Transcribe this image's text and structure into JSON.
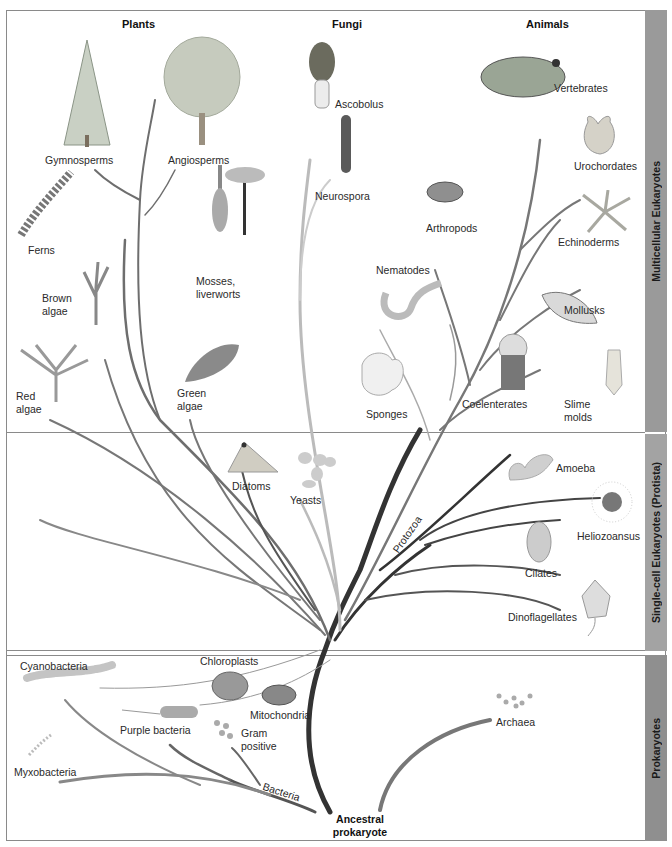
{
  "diagram": {
    "column_headers": [
      "Plants",
      "Fungi",
      "Animals"
    ],
    "side_bands": {
      "multicellular": "Multicellular Eukaryotes",
      "single_cell": "Single-cell Eukaryotes (Protista)",
      "prokaryotes": "Prokaryotes"
    },
    "plants": {
      "gymnosperms": "Gymnosperms",
      "angiosperms": "Angiosperms",
      "ferns": "Ferns",
      "mosses_line1": "Mosses,",
      "mosses_line2": "liverworts",
      "brown_line1": "Brown",
      "brown_line2": "algae",
      "red_line1": "Red",
      "red_line2": "algae",
      "green_line1": "Green",
      "green_line2": "algae"
    },
    "fungi": {
      "ascobolus": "Ascobolus",
      "neurospora": "Neurospora",
      "yeasts": "Yeasts"
    },
    "animals": {
      "vertebrates": "Vertebrates",
      "urochordates": "Urochordates",
      "echinoderms": "Echinoderms",
      "arthropods": "Arthropods",
      "nematodes": "Nematodes",
      "mollusks": "Mollusks",
      "sponges": "Sponges",
      "coelenterates": "Coelenterates",
      "slime_line1": "Slime",
      "slime_line2": "molds"
    },
    "protista": {
      "diatoms": "Diatoms",
      "amoeba": "Amoeba",
      "heliozoansus": "Heliozoansus",
      "cilates": "Cilates",
      "dinoflagellates": "Dinoflagellates",
      "protozoa": "Protozoa"
    },
    "prokaryotes": {
      "cyanobacteria": "Cyanobacteria",
      "chloroplasts": "Chloroplasts",
      "mitochondria": "Mitochondria",
      "purple_bacteria": "Purple bacteria",
      "gram_line1": "Gram",
      "gram_line2": "positive",
      "myxobacteria": "Myxobacteria",
      "bacteria": "Bacteria",
      "archaea": "Archaea",
      "root_line1": "Ancestral",
      "root_line2": "prokaryote"
    },
    "colors": {
      "frame": "#8a8a8a",
      "side_band": "#9a9a9a",
      "branch_dark": "#333333",
      "branch_mid": "#6e6e6e",
      "branch_light": "#b5b5b5"
    }
  }
}
